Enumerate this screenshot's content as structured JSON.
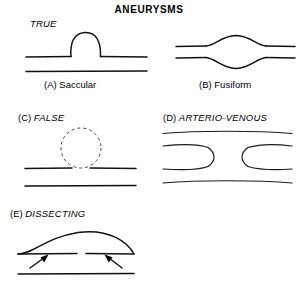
{
  "title": "ANEURYSMS",
  "groups": {
    "true_label": "TRUE",
    "false_tag": "(C)",
    "false_name": "FALSE",
    "av_tag": "(D)",
    "av_name": "ARTERIO-VENOUS",
    "dissecting_tag": "(E)",
    "dissecting_name": "DISSECTING"
  },
  "panels": [
    {
      "id": "a",
      "caption": "(A) Saccular",
      "type": "saccular"
    },
    {
      "id": "b",
      "caption": "(B) Fusiform",
      "type": "fusiform"
    },
    {
      "id": "c",
      "caption": "",
      "type": "false-aneurysm"
    },
    {
      "id": "d",
      "caption": "",
      "type": "arterio-venous"
    },
    {
      "id": "e",
      "caption": "",
      "type": "dissecting"
    }
  ],
  "colors": {
    "ink": "#111111",
    "dashed": "#444444",
    "background": "#ffffff"
  }
}
